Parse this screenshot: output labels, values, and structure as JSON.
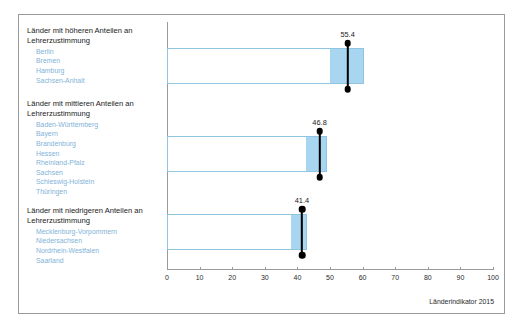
{
  "chart_data": {
    "type": "bar",
    "title": "",
    "subtitle": "",
    "xlabel": "",
    "ylabel": "",
    "xlim": [
      0,
      100
    ],
    "xticks": [
      0,
      10,
      20,
      30,
      40,
      50,
      60,
      70,
      80,
      90,
      100
    ],
    "xtick_labels": [
      "0",
      "10",
      "20",
      "30",
      "40",
      "50",
      "60",
      "70",
      "80",
      "90",
      "100"
    ],
    "grid": false,
    "legend": "none",
    "orientation": "horizontal",
    "categories": [
      "Länder mit höheren Anteilen an\nLehrerzustimmung",
      "Länder mit mittleren Anteilen an\nLehrerzustimmung",
      "Länder mit niedrigeren Anteilen an\nLehrerzustimmung"
    ],
    "values": [
      55.4,
      46.8,
      41.4
    ],
    "value_labels": [
      "55.4",
      "46.8",
      "41.4"
    ],
    "boxes": [
      {
        "box_start": 0,
        "box_end": 60.5,
        "fill_start": 50.0,
        "fill_end": 60.5,
        "marker": 55.4,
        "whisker_low": 50.0,
        "whisker_high": 60.5
      },
      {
        "box_start": 0,
        "box_end": 49.0,
        "fill_start": 42.5,
        "fill_end": 49.0,
        "marker": 46.8,
        "whisker_low": 42.5,
        "whisker_high": 49.0
      },
      {
        "box_start": 0,
        "box_end": 43.0,
        "fill_start": 38.0,
        "fill_end": 43.0,
        "marker": 41.4,
        "whisker_low": 38.0,
        "whisker_high": 43.0
      }
    ]
  },
  "groups": [
    {
      "title": "Länder mit höheren Anteilen an\nLehrerzustimmung",
      "value_label": "55.4",
      "members": [
        "Berlin",
        "Bremen",
        "Hamburg",
        "Sachsen-Anhalt"
      ]
    },
    {
      "title": "Länder mit mittleren Anteilen an\nLehrerzustimmung",
      "value_label": "46.8",
      "members": [
        "Baden-Württemberg",
        "Bayern",
        "Brandenburg",
        "Hessen",
        "Rheinland-Pfalz",
        "Sachsen",
        "Schleswig-Holstein",
        "Thüringen"
      ]
    },
    {
      "title": "Länder mit niedrigeren Anteilen an\nLehrerzustimmung",
      "value_label": "41.4",
      "members": [
        "Mecklenburg-Vorpommern",
        "Niedersachsen",
        "Nordrhein-Westfalen",
        "Saarland"
      ]
    }
  ],
  "footer": {
    "source": "Länderindikator 2015"
  },
  "colors": {
    "box_border": "#8fc4e3",
    "box_fill": "#a8d5f0",
    "marker": "#000000",
    "member_text": "#7fb3d8",
    "title_text": "#1a1a1a",
    "axis": "#9a9a9a",
    "frame": "#9a9a9a",
    "background": "#ffffff"
  }
}
